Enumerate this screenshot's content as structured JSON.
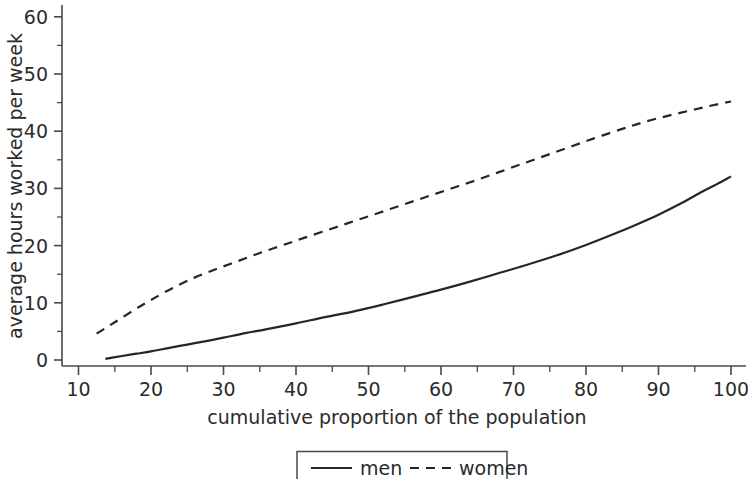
{
  "chart_data": {
    "type": "line",
    "title": "",
    "subtitle": "",
    "xlabel": "cumulative proportion of the population",
    "ylabel": "average hours worked per week",
    "xlim": [
      10,
      101.5
    ],
    "ylim": [
      -1,
      61
    ],
    "grid": false,
    "legend_position": "bottom-center",
    "x_ticks_major": [
      10,
      20,
      30,
      40,
      50,
      60,
      70,
      80,
      90,
      100
    ],
    "x_tick_labels": [
      "10",
      "20",
      "30",
      "40",
      "50",
      "60",
      "70",
      "80",
      "90",
      "100"
    ],
    "x_ticks_minor": [
      15,
      25,
      35,
      45,
      55,
      65,
      75,
      85,
      95
    ],
    "y_ticks_major": [
      0,
      10,
      20,
      30,
      40,
      50,
      60
    ],
    "y_tick_labels": [
      "0",
      "10",
      "20",
      "30",
      "40",
      "50",
      "60"
    ],
    "y_ticks_minor": [
      5,
      15,
      25,
      35,
      45,
      55
    ],
    "series": [
      {
        "name": "men",
        "style": "solid",
        "color": "#262626",
        "x": [
          13.7,
          16,
          18,
          20,
          22,
          25,
          28,
          30,
          33,
          36,
          40,
          44,
          48,
          52,
          56,
          60,
          64,
          68,
          72,
          76,
          80,
          84,
          87,
          90,
          93,
          96,
          98,
          100
        ],
        "y": [
          0.2,
          0.7,
          1.1,
          1.5,
          2.0,
          2.7,
          3.4,
          3.9,
          4.7,
          5.4,
          6.4,
          7.5,
          8.5,
          9.7,
          11.0,
          12.3,
          13.7,
          15.2,
          16.7,
          18.3,
          20.1,
          22.1,
          23.7,
          25.4,
          27.3,
          29.4,
          30.7,
          32.1
        ]
      },
      {
        "name": "women",
        "style": "dashed",
        "color": "#262626",
        "x": [
          12.5,
          15,
          18,
          20,
          23,
          26,
          29,
          32,
          35,
          38,
          41,
          45,
          49,
          53,
          57,
          61,
          65,
          69,
          73,
          77,
          81,
          85,
          88,
          91,
          94,
          97,
          100
        ],
        "y": [
          4.6,
          6.6,
          9.0,
          10.5,
          12.6,
          14.4,
          15.9,
          17.3,
          18.7,
          20.0,
          21.3,
          23.0,
          24.7,
          26.4,
          28.1,
          29.8,
          31.5,
          33.3,
          35.1,
          36.9,
          38.7,
          40.4,
          41.6,
          42.6,
          43.5,
          44.4,
          45.2
        ]
      }
    ],
    "legend_entries": [
      {
        "label": "men",
        "style": "solid"
      },
      {
        "label": "women",
        "style": "dashed"
      }
    ],
    "colors": {
      "background": "#ffffff",
      "axis": "#4a4a4a",
      "text": "#2b2b2b",
      "series": "#262626"
    }
  }
}
